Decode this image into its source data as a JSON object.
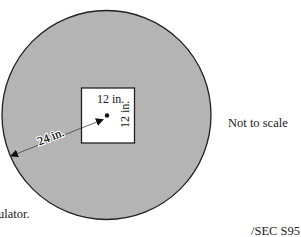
{
  "diagram": {
    "type": "geometry-figure",
    "shapes": {
      "circle": {
        "fill": "#b4b4b4",
        "stroke": "#222222",
        "radius_label": "24 in."
      },
      "square": {
        "fill": "#ffffff",
        "stroke": "#222222",
        "top_side_label": "12 in.",
        "right_side_label": "12 in."
      },
      "center_point": {
        "fill": "#111111"
      }
    },
    "labels": {
      "radius": "24 in.",
      "square_width": "12 in.",
      "square_height": "12 in."
    },
    "notes": {
      "scale_note": "Not to scale",
      "partial_text": "ulator.",
      "reference_code": "/SEC S95"
    }
  }
}
